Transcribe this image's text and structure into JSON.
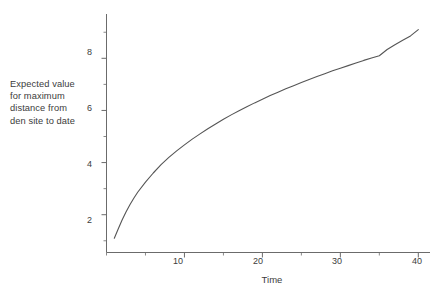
{
  "chart_data": {
    "type": "line",
    "title": "",
    "xlabel": "Time",
    "ylabel": "Expected value for maximum distance from den site to date",
    "ylabel_lines": [
      "Expected value",
      "for maximum",
      "distance from",
      "den site to date"
    ],
    "xlim": [
      0,
      41.5
    ],
    "ylim": [
      0.55,
      9.7
    ],
    "xticks": [
      10,
      20,
      30,
      40
    ],
    "yticks": [
      2,
      4,
      6,
      8
    ],
    "xticklabels": [
      "10",
      "20",
      "30",
      "40"
    ],
    "yticklabels": [
      "2",
      "4",
      "6",
      "8"
    ],
    "x_minor_tick_step": 5,
    "y_minor_tick_step": 1,
    "grid": false,
    "legend": false,
    "legend_position": "none",
    "line_color": "#555555",
    "axis_color": "#6b6b6b",
    "background_color": "#ffffff",
    "series": [
      {
        "name": "Expected maximum distance from den site",
        "x": [
          1,
          1.5,
          2,
          2.5,
          3,
          3.5,
          4,
          5,
          6,
          7,
          8,
          9,
          10,
          11,
          12,
          13,
          14,
          15,
          16,
          17,
          18,
          19,
          20,
          21,
          22,
          23,
          24,
          25,
          26,
          27,
          28,
          29,
          30,
          31,
          32,
          33,
          34,
          35,
          36,
          37,
          38,
          39,
          40
        ],
        "y": [
          1.1,
          1.45,
          1.8,
          2.1,
          2.38,
          2.63,
          2.86,
          3.25,
          3.6,
          3.92,
          4.2,
          4.45,
          4.68,
          4.9,
          5.1,
          5.3,
          5.48,
          5.66,
          5.83,
          5.99,
          6.14,
          6.29,
          6.43,
          6.57,
          6.7,
          6.83,
          6.95,
          7.07,
          7.19,
          7.3,
          7.41,
          7.52,
          7.62,
          7.72,
          7.82,
          7.92,
          8.01,
          8.1,
          8.34,
          8.52,
          8.69,
          8.86,
          9.1
        ]
      }
    ]
  }
}
